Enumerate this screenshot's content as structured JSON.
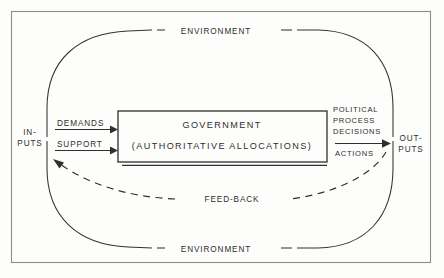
{
  "diagram": {
    "frame": {
      "name": "outer-border"
    },
    "environment": {
      "top_label": "ENVIRONMENT",
      "bottom_label": "ENVIRONMENT"
    },
    "inputs": {
      "label_line1": "IN-",
      "label_line2": "PUTS",
      "arrows": [
        {
          "label": "DEMANDS"
        },
        {
          "label": "SUPPORT"
        }
      ]
    },
    "government": {
      "title": "GOVERNMENT",
      "subtitle": "(AUTHORITATIVE ALLOCATIONS)"
    },
    "conversion": {
      "line1": "POLITICAL",
      "line2": "PROCESS",
      "line3": "DECISIONS",
      "line4": "ACTIONS"
    },
    "outputs": {
      "label_line1": "OUT-",
      "label_line2": "PUTS"
    },
    "feedback": {
      "label": "FEED-BACK"
    },
    "colors": {
      "background": "#fdfdfc",
      "ink": "#2f2f2f",
      "frame": "#8c8c8c",
      "text": "#2e2e2e"
    }
  }
}
